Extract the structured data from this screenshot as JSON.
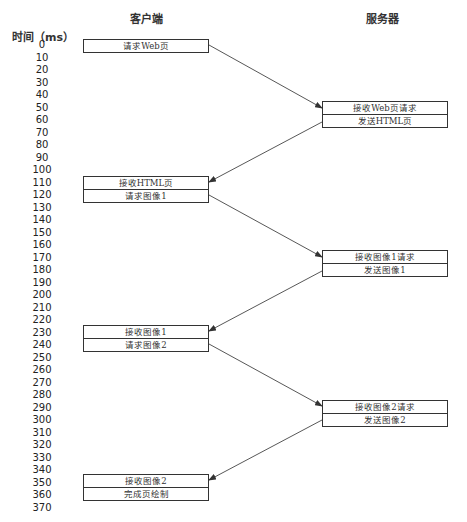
{
  "headers": {
    "axis_title": "时间（ms）",
    "client": "客户端",
    "server": "服务器"
  },
  "ticks": [
    "0",
    "10",
    "20",
    "30",
    "40",
    "50",
    "60",
    "70",
    "80",
    "90",
    "100",
    "110",
    "120",
    "130",
    "140",
    "150",
    "160",
    "170",
    "180",
    "190",
    "200",
    "210",
    "220",
    "230",
    "240",
    "250",
    "260",
    "270",
    "280",
    "290",
    "300",
    "310",
    "320",
    "330",
    "340",
    "350",
    "360",
    "370"
  ],
  "client_boxes": [
    {
      "rows": [
        "请求Web页"
      ],
      "top": 39
    },
    {
      "rows": [
        "接收HTML页",
        "请求图像1"
      ],
      "top": 176
    },
    {
      "rows": [
        "接收图像1",
        "请求图像2"
      ],
      "top": 325
    },
    {
      "rows": [
        "接收图像2",
        "完成页绘制"
      ],
      "top": 474
    }
  ],
  "server_boxes": [
    {
      "rows": [
        "接收Web页请求",
        "发送HTML页"
      ],
      "top": 101
    },
    {
      "rows": [
        "接收图像1请求",
        "发送图像1"
      ],
      "top": 250
    },
    {
      "rows": [
        "接收图像2请求",
        "发送图像2"
      ],
      "top": 400
    }
  ],
  "arrows": [
    {
      "from": [
        209,
        45
      ],
      "to": [
        322,
        108
      ]
    },
    {
      "from": [
        322,
        122
      ],
      "to": [
        209,
        182
      ]
    },
    {
      "from": [
        209,
        195
      ],
      "to": [
        322,
        257
      ]
    },
    {
      "from": [
        322,
        271
      ],
      "to": [
        209,
        331
      ]
    },
    {
      "from": [
        209,
        344
      ],
      "to": [
        322,
        406
      ]
    },
    {
      "from": [
        322,
        420
      ],
      "to": [
        209,
        480
      ]
    }
  ],
  "colors": {
    "line": "#444444",
    "text": "#333333"
  }
}
